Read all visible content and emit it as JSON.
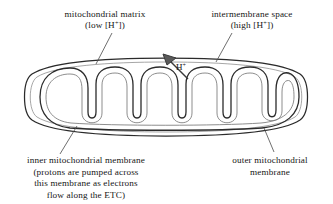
{
  "figure": {
    "stroke_color": "#2b2b2b",
    "shading_color": "#b9b9b9",
    "background": "#ffffff"
  },
  "labels": {
    "matrix": {
      "line1": "mitochondrial matrix",
      "line2_prefix": "(low [H",
      "line2_sup": "+",
      "line2_suffix": "])"
    },
    "intermembrane": {
      "line1": "intermembrane space",
      "line2_prefix": "(high [H",
      "line2_sup": "+",
      "line2_suffix": "])"
    },
    "inner_membrane": {
      "line1": "inner mitochondrial membrane",
      "line2": "(protons are pumped across",
      "line3": "this membrane as electrons",
      "line4": "flow along the ETC)"
    },
    "outer_membrane": {
      "line1": "outer mitochondrial",
      "line2": "membrane"
    }
  },
  "annotations": {
    "proton": {
      "text_prefix": "H",
      "text_sup": "+"
    }
  }
}
